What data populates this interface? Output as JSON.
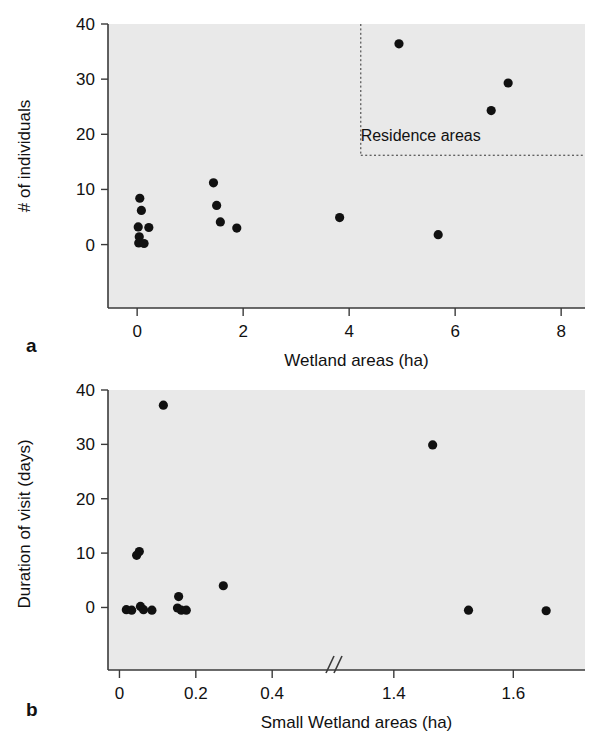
{
  "figure": {
    "background_color": "#ffffff",
    "plot_background_color": "#e9e9e9",
    "axis_color": "#3a3a3a",
    "marker_color": "#111111",
    "panel_a_letter": "a",
    "panel_b_letter": "b"
  },
  "chart_data": [
    {
      "type": "scatter",
      "panel": "a",
      "title": "",
      "xlabel": "Wetland areas (ha)",
      "ylabel": "# of individuals",
      "xlim": [
        -0.55,
        8.45
      ],
      "ylim": [
        -11.5,
        40
      ],
      "xticks": [
        0,
        2,
        4,
        6,
        8
      ],
      "xticklabels": [
        "0",
        "2",
        "4",
        "6",
        "8"
      ],
      "yticks": [
        0,
        10,
        20,
        30,
        40
      ],
      "yticklabels": [
        "0",
        "10",
        "20",
        "30",
        "40"
      ],
      "grid": false,
      "legend": "none",
      "axis_break": false,
      "points": [
        {
          "x": 0.05,
          "y": 8.4
        },
        {
          "x": 0.08,
          "y": 6.2
        },
        {
          "x": 0.02,
          "y": 3.2
        },
        {
          "x": 0.22,
          "y": 3.1
        },
        {
          "x": 0.04,
          "y": 1.4
        },
        {
          "x": 0.03,
          "y": 0.3
        },
        {
          "x": 0.13,
          "y": 0.2
        },
        {
          "x": 1.44,
          "y": 11.2
        },
        {
          "x": 1.5,
          "y": 7.1
        },
        {
          "x": 1.57,
          "y": 4.1
        },
        {
          "x": 1.88,
          "y": 3.0
        },
        {
          "x": 3.82,
          "y": 4.9
        },
        {
          "x": 5.68,
          "y": 1.8
        },
        {
          "x": 4.94,
          "y": 36.4
        },
        {
          "x": 6.68,
          "y": 24.3
        },
        {
          "x": 7.0,
          "y": 29.3
        }
      ],
      "annotations": [
        {
          "text": "Residence areas",
          "x": 5.35,
          "y": 19.5,
          "box": {
            "x0": 4.22,
            "y0": 16.2,
            "x1": 8.45,
            "y1": 40.0,
            "style": "dotted"
          }
        }
      ]
    },
    {
      "type": "scatter",
      "panel": "b",
      "title": "",
      "xlabel": "Small Wetland areas (ha)",
      "ylabel": "Duration of visit (days)",
      "xlim": [
        -0.03,
        0.52
      ],
      "xlim2": [
        1.33,
        1.72
      ],
      "ylim": [
        -11.5,
        40
      ],
      "xticks": [
        0,
        0.2,
        0.4,
        1.4,
        1.6
      ],
      "xticklabels": [
        "0",
        "0.2",
        "0.4",
        "1.4",
        "1.6"
      ],
      "yticks": [
        0,
        10,
        20,
        30,
        40
      ],
      "yticklabels": [
        "0",
        "10",
        "20",
        "30",
        "40"
      ],
      "grid": false,
      "legend": "none",
      "axis_break": true,
      "axis_break_marker": "//",
      "points": [
        {
          "x": 0.115,
          "y": 37.2
        },
        {
          "x": 0.052,
          "y": 10.3
        },
        {
          "x": 0.045,
          "y": 9.6
        },
        {
          "x": 0.155,
          "y": 2.0
        },
        {
          "x": 0.272,
          "y": 4.0
        },
        {
          "x": 0.018,
          "y": -0.4
        },
        {
          "x": 0.032,
          "y": -0.5
        },
        {
          "x": 0.055,
          "y": 0.2
        },
        {
          "x": 0.063,
          "y": -0.4
        },
        {
          "x": 0.085,
          "y": -0.5
        },
        {
          "x": 0.152,
          "y": -0.1
        },
        {
          "x": 0.162,
          "y": -0.5
        },
        {
          "x": 0.175,
          "y": -0.5
        },
        {
          "x": 1.465,
          "y": 29.9
        },
        {
          "x": 1.525,
          "y": -0.5
        },
        {
          "x": 1.655,
          "y": -0.6
        }
      ],
      "annotations": []
    }
  ]
}
